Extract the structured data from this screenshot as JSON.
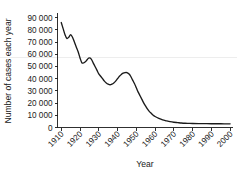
{
  "chart_data": {
    "type": "line",
    "title": "",
    "xlabel": "Year",
    "ylabel": "Number of cases each year",
    "xlim": [
      1908,
      2001
    ],
    "ylim": [
      0,
      93000
    ],
    "grid": false,
    "legend": null,
    "line_color": "#1a1a1a",
    "background_color": "#ffffff",
    "x_tick_labels": [
      "1910",
      "1920",
      "1930",
      "1940",
      "1950",
      "1960",
      "1970",
      "1980",
      "1990",
      "2000"
    ],
    "x_ticks": [
      1910,
      1920,
      1930,
      1940,
      1950,
      1960,
      1970,
      1980,
      1990,
      2000
    ],
    "x_tick_rotation_deg": 45,
    "y_tick_labels": [
      "0",
      "10 000",
      "20 000",
      "30 000",
      "40 000",
      "50 000",
      "60 000",
      "70 000",
      "80 000",
      "90 000"
    ],
    "y_ticks": [
      0,
      10000,
      20000,
      30000,
      40000,
      50000,
      60000,
      70000,
      80000,
      90000
    ],
    "thousands_separator": " ",
    "series": [
      {
        "name": "Cases",
        "x": [
          1910,
          1911,
          1912,
          1913,
          1914,
          1915,
          1916,
          1917,
          1918,
          1919,
          1920,
          1921,
          1922,
          1923,
          1924,
          1925,
          1926,
          1927,
          1928,
          1929,
          1930,
          1931,
          1932,
          1933,
          1934,
          1935,
          1936,
          1937,
          1938,
          1939,
          1940,
          1941,
          1942,
          1943,
          1944,
          1945,
          1946,
          1947,
          1948,
          1949,
          1950,
          1951,
          1952,
          1953,
          1954,
          1955,
          1956,
          1957,
          1958,
          1959,
          1960,
          1962,
          1964,
          1966,
          1968,
          1970,
          1972,
          1974,
          1976,
          1978,
          1980,
          1985,
          1990,
          1995,
          2000
        ],
        "y": [
          86000,
          81000,
          76000,
          73000,
          74000,
          76000,
          74000,
          70000,
          66000,
          62000,
          57000,
          53000,
          53000,
          54000,
          56000,
          57000,
          56000,
          53000,
          50000,
          47000,
          44000,
          42000,
          40000,
          38000,
          36500,
          35500,
          35000,
          35500,
          36500,
          38000,
          40000,
          42000,
          43500,
          44500,
          45000,
          45000,
          44000,
          42000,
          39000,
          36000,
          32500,
          29000,
          26000,
          23000,
          20000,
          17500,
          15000,
          13000,
          11500,
          10000,
          9000,
          7500,
          6300,
          5500,
          4800,
          4300,
          4000,
          3700,
          3500,
          3400,
          3300,
          3200,
          3100,
          3050,
          3000
        ]
      }
    ]
  }
}
